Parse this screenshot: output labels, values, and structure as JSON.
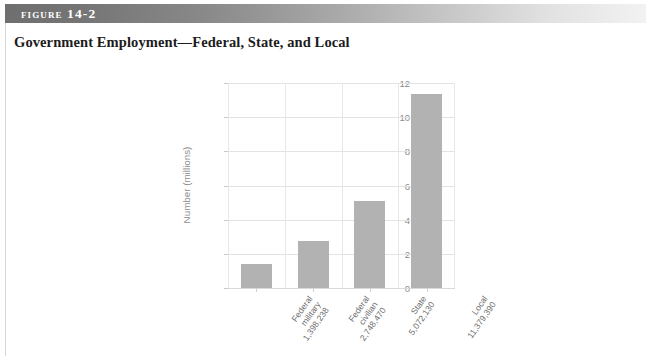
{
  "figure": {
    "label": "Figure 14-2",
    "title": "Government Employment—Federal, State, and Local"
  },
  "colors": {
    "bar": "#b2b2b2",
    "grid": "#e3e3e3",
    "header_dark": "#6f6f6f",
    "header_light": "#f2f2f2",
    "tick_text": "#8a8a8a",
    "title_text": "#1c1c1c"
  },
  "chart_data": {
    "type": "bar",
    "title": "Government Employment—Federal, State, and Local",
    "xlabel": "",
    "ylabel": "Number (millions)",
    "ylim": [
      0,
      12
    ],
    "yticks": [
      0,
      2,
      4,
      6,
      8,
      10,
      12
    ],
    "ytick_labels": [
      "0",
      "2",
      "4",
      "6",
      "8",
      "10",
      "12"
    ],
    "grid": true,
    "legend": false,
    "categories": [
      "Federal military",
      "Federal civilian",
      "State",
      "Local"
    ],
    "category_lines": [
      [
        "Federal",
        "military",
        "1,398,238"
      ],
      [
        "Federal",
        "civilian",
        "2,748,470"
      ],
      [
        "State",
        "5,072,130"
      ],
      [
        "Local",
        "11,379,390"
      ]
    ],
    "data_labels": [
      "1,398,238",
      "2,748,470",
      "5,072,130",
      "11,379,390"
    ],
    "raw_values": [
      1398238,
      2748470,
      5072130,
      11379390
    ],
    "values": [
      1.398,
      2.748,
      5.072,
      11.379
    ]
  }
}
